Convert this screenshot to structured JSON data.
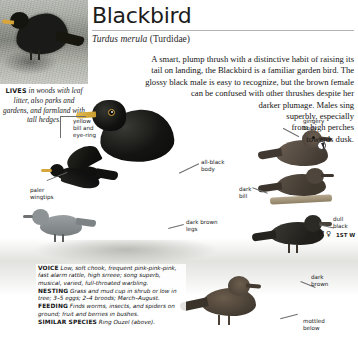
{
  "header": {
    "title": "Blackbird",
    "scientific_name": "Turdus merula",
    "family": "(Turdidae)"
  },
  "description": {
    "lines": [
      "A smart, plump thrush with a distinctive habit of raising its",
      "tail on landing, the Blackbird is a familiar garden bird. The",
      "glossy black male is easy to recognize, but the brown female",
      "can be confused with other thrushes despite her",
      "darker plumage. Males sing",
      "superbly, especially",
      "from high perches",
      "towards dusk."
    ]
  },
  "habitat_caption": {
    "keyword": "LIVES",
    "text": " in woods with leaf litter, also parks and gardens, and farmland with tall hedges."
  },
  "annotations": [
    {
      "name": "yellow-bill-and-eye-ring",
      "text": "yellow\nbill and\neye-ring"
    },
    {
      "name": "paler-wingtips",
      "text": "paler\nwingtips"
    },
    {
      "name": "all-black-body",
      "text": "all-black\nbody"
    },
    {
      "name": "dark-bill",
      "text": "dark\nbill"
    },
    {
      "name": "dark-brown-legs",
      "text": "dark brown\nlegs"
    },
    {
      "name": "gingery-body",
      "text": "gingery\nbody"
    },
    {
      "name": "dull-black",
      "text": "dull\nblack"
    },
    {
      "name": "dark-brown",
      "text": "dark\nbrown"
    },
    {
      "name": "mottled-below",
      "text": "mottled\nbelow"
    }
  ],
  "badges": {
    "male_symbol": "♂",
    "female_symbol": "♀",
    "first_winter": "1ST W"
  },
  "facts": [
    {
      "label": "VOICE",
      "text": "Low, soft chook, frequent pink-pink-pink, fast alarm rattle, high srreee; song superb, musical, varied, full-throated warbling."
    },
    {
      "label": "NESTING",
      "text": "Grass and mud cup in shrub or low in tree; 3–5 eggs; 2–4 broods; March–August."
    },
    {
      "label": "FEEDING",
      "text": "Finds worms, insects, and spiders on ground; fruit and berries in bushes."
    },
    {
      "label": "SIMILAR SPECIES",
      "text": "Ring Ouzel (above)."
    }
  ],
  "colors": {
    "rule": "#b4b4b4",
    "text": "#141414",
    "bill_yellow": "#d8a53a",
    "female_brown": "#5c5147"
  }
}
